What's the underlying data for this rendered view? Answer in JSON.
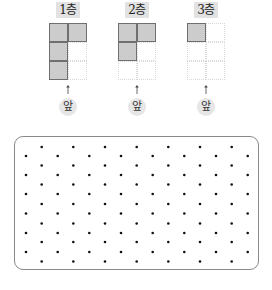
{
  "floors": [
    {
      "label": "1층",
      "front_label": "앞",
      "cols": 2,
      "rows": 3,
      "filled": [
        [
          0,
          0
        ],
        [
          0,
          1
        ],
        [
          1,
          0
        ],
        [
          2,
          0
        ]
      ]
    },
    {
      "label": "2층",
      "front_label": "앞",
      "cols": 2,
      "rows": 3,
      "filled": [
        [
          0,
          0
        ],
        [
          0,
          1
        ],
        [
          1,
          0
        ]
      ]
    },
    {
      "label": "3층",
      "front_label": "앞",
      "cols": 2,
      "rows": 3,
      "filled": [
        [
          0,
          0
        ]
      ]
    }
  ],
  "colors": {
    "filled_cell": "#cccccc",
    "filled_border": "#6f6f6f",
    "empty_border": "#d8d8d8",
    "label_bg": "#e2e2e2",
    "dot": "#111111",
    "panel_border": "#8a8a8a"
  },
  "dot_grid": {
    "type": "isometric-dot-paper",
    "odd_rows_y": [
      146,
      164.5,
      183.5,
      203,
      222.5,
      241,
      260.5
    ],
    "odd_rows_x": [
      40.7,
      72.3,
      104,
      135.7,
      167.3,
      199,
      230.7
    ],
    "even_rows_y": [
      155,
      174,
      193,
      212.5,
      232,
      251
    ],
    "even_rows_x": [
      25,
      56.7,
      88.3,
      120,
      151.7,
      183.3,
      215,
      246.7
    ]
  }
}
